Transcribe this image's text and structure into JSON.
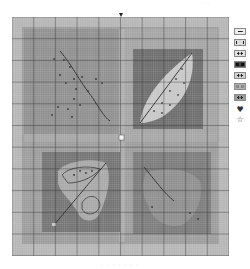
{
  "captions": {
    "top": "· · ·",
    "bottom": "· · ·   ·  · · ·"
  },
  "chart": {
    "type": "cross-stitch pattern chart",
    "grid": {
      "columns": 100,
      "rows": 110,
      "major_every": 10
    },
    "colors": {
      "background": "#9a9a9a",
      "outer_band": "#b4b4b4",
      "panel_tl": "#8e8e8e",
      "panel_tr": "#6e6e6e",
      "panel_bl": "#727272",
      "panel_br": "#7c7c7c",
      "leaf_light": "#c9c9c9",
      "leaf_mid": "#a6a6a6",
      "backstitch": "#1e1e1e",
      "minor_grid": "#d9d9d9",
      "major_grid": "#2a2a2a"
    },
    "panels": [
      {
        "id": "top-left",
        "motif": "leaf stem with scattered dots"
      },
      {
        "id": "top-right",
        "motif": "elongated leaf with midrib"
      },
      {
        "id": "bottom-left",
        "motif": "lobed leaf with curled outline"
      },
      {
        "id": "bottom-right",
        "motif": "maple-style leaf with stem"
      }
    ],
    "center_markers": [
      "top",
      "bottom",
      "left",
      "right",
      "center"
    ]
  },
  "legend": {
    "items": [
      {
        "symbol": "dash",
        "shade": "#ededed"
      },
      {
        "symbol": "bars",
        "shade": "#dcdcdc"
      },
      {
        "symbol": "dots",
        "shade": "#e4e4e4"
      },
      {
        "symbol": "squares",
        "shade": "#4a4a4a"
      },
      {
        "symbol": "dots",
        "shade": "#d2d2d2"
      },
      {
        "symbol": "blocks",
        "shade": "#b0b0b0"
      },
      {
        "symbol": "dots",
        "shade": "#9c9c9c"
      }
    ],
    "glyphs": [
      {
        "name": "heart",
        "char": "♥"
      },
      {
        "name": "star",
        "char": "☆"
      }
    ]
  }
}
